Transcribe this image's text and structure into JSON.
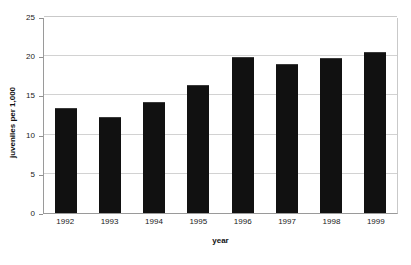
{
  "chart_data": {
    "type": "bar",
    "title": "",
    "xlabel": "year",
    "ylabel": "juveniles per 1,000",
    "categories": [
      "1992",
      "1993",
      "1994",
      "1995",
      "1996",
      "1997",
      "1998",
      "1999"
    ],
    "values": [
      13.4,
      12.2,
      14.2,
      16.3,
      19.9,
      19.0,
      19.8,
      20.6
    ],
    "ylim": [
      0,
      25
    ],
    "yticks": [
      0,
      5,
      10,
      15,
      20,
      25
    ],
    "ytick_labels": [
      "0",
      "5",
      "10",
      "15",
      "20",
      "25"
    ],
    "grid": true,
    "legend": false,
    "legend_position": "none",
    "bar_color": "#111111",
    "gridline_color": "#d2d2d2",
    "axis_color": "#9a9a9a",
    "background_color": "#ffffff"
  }
}
